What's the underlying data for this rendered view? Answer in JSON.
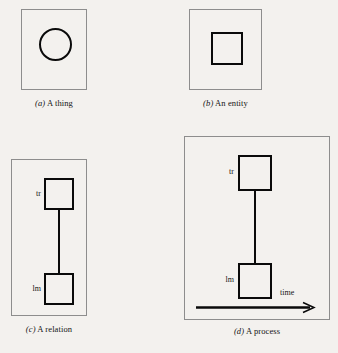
{
  "figure": {
    "background_color": "#f3f1ee",
    "ink_color": "#0a0a0a",
    "frame_color": "#8d8d8d"
  },
  "panels": [
    {
      "id": "a",
      "letter": "(a)",
      "caption": "A thing",
      "shape": "circle",
      "labels": []
    },
    {
      "id": "b",
      "letter": "(b)",
      "caption": "An entity",
      "shape": "square",
      "labels": []
    },
    {
      "id": "c",
      "letter": "(c)",
      "caption": "A relation",
      "shape": "two-squares-linked",
      "labels": [
        {
          "name": "tr",
          "text": "tr"
        },
        {
          "name": "lm",
          "text": "lm"
        }
      ]
    },
    {
      "id": "d",
      "letter": "(d)",
      "caption": "A process",
      "shape": "two-squares-linked-with-time-axis",
      "labels": [
        {
          "name": "tr",
          "text": "tr"
        },
        {
          "name": "lm",
          "text": "lm"
        }
      ],
      "axis": {
        "label": "time",
        "direction": "right"
      }
    }
  ]
}
